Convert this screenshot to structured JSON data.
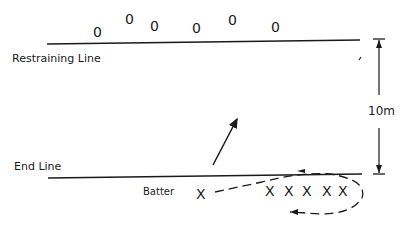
{
  "labels": {
    "restraining_line": "Restraining Line",
    "end_line": "End Line",
    "batter": "Batter",
    "distance": "10m"
  },
  "fielders": [
    {
      "symbol": "0",
      "x": 95,
      "y": 25
    },
    {
      "symbol": "0",
      "x": 127,
      "y": 13
    },
    {
      "symbol": "0",
      "x": 152,
      "y": 20
    },
    {
      "symbol": "0",
      "x": 194,
      "y": 21
    },
    {
      "symbol": "0",
      "x": 230,
      "y": 14
    },
    {
      "symbol": "0",
      "x": 273,
      "y": 21
    }
  ],
  "batter_symbol": "X",
  "waiting_batters": [
    "X",
    "X",
    "X",
    "X",
    "X"
  ],
  "colors": {
    "ink": "#1a1a1a",
    "background": "#ffffff"
  }
}
